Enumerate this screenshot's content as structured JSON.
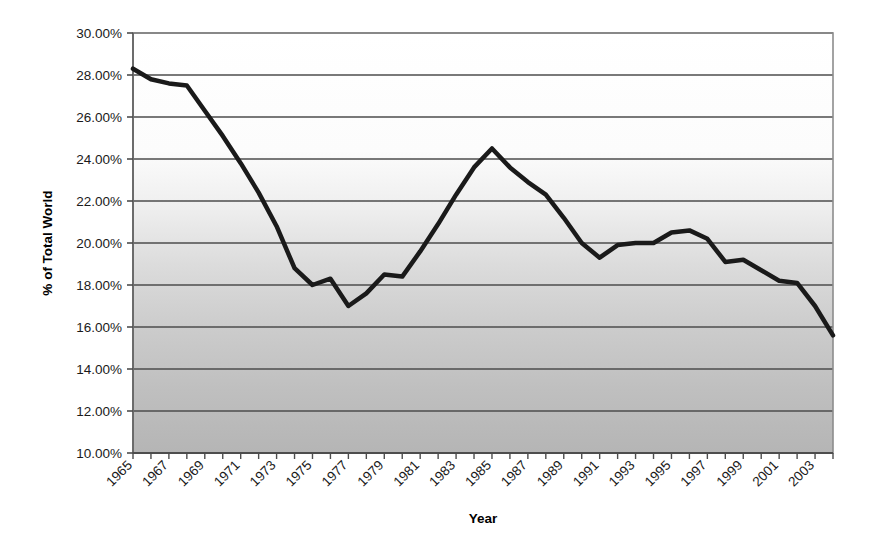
{
  "chart_data": {
    "type": "line",
    "title": "",
    "xlabel": "Year",
    "ylabel": "% of Total World",
    "xlim": [
      1965,
      2004
    ],
    "ylim": [
      10.0,
      30.0
    ],
    "ytick_step": 2.0,
    "grid": true,
    "legend": null,
    "yticks": [
      "10.00%",
      "12.00%",
      "14.00%",
      "16.00%",
      "18.00%",
      "20.00%",
      "22.00%",
      "24.00%",
      "26.00%",
      "28.00%",
      "30.00%"
    ],
    "ytick_values": [
      10.0,
      12.0,
      14.0,
      16.0,
      18.0,
      20.0,
      22.0,
      24.0,
      26.0,
      28.0,
      30.0
    ],
    "xticks": [
      "1965",
      "1967",
      "1969",
      "1971",
      "1973",
      "1975",
      "1977",
      "1979",
      "1981",
      "1983",
      "1985",
      "1987",
      "1989",
      "1991",
      "1993",
      "1995",
      "1997",
      "1999",
      "2001",
      "2003"
    ],
    "xtick_values": [
      1965,
      1967,
      1969,
      1971,
      1973,
      1975,
      1977,
      1979,
      1981,
      1983,
      1985,
      1987,
      1989,
      1991,
      1993,
      1995,
      1997,
      1999,
      2001,
      2003
    ],
    "x": [
      1965,
      1966,
      1967,
      1968,
      1969,
      1970,
      1971,
      1972,
      1973,
      1974,
      1975,
      1976,
      1977,
      1978,
      1979,
      1980,
      1981,
      1982,
      1983,
      1984,
      1985,
      1986,
      1987,
      1988,
      1989,
      1990,
      1991,
      1992,
      1993,
      1994,
      1995,
      1996,
      1997,
      1998,
      1999,
      2000,
      2001,
      2002,
      2003,
      2004
    ],
    "values": [
      28.3,
      27.8,
      27.6,
      27.5,
      26.3,
      25.1,
      23.8,
      22.4,
      20.8,
      18.8,
      18.0,
      18.3,
      17.0,
      17.6,
      18.5,
      18.4,
      19.6,
      20.9,
      22.3,
      23.6,
      24.5,
      23.6,
      22.9,
      22.3,
      21.2,
      20.0,
      19.3,
      19.9,
      20.0,
      20.0,
      20.5,
      20.6,
      20.2,
      19.1,
      19.2,
      18.7,
      18.2,
      18.1,
      17.0,
      15.6
    ],
    "series_name": "",
    "line_color": "#1a1a1a",
    "line_width": 4.5,
    "plot_bg_top": "#ffffff",
    "plot_bg_bottom": "#b8b8b8",
    "gridline_color": "#4d4d4d",
    "axis_color": "#808080"
  },
  "axis": {
    "y_title": "% of Total World",
    "x_title": "Year"
  }
}
